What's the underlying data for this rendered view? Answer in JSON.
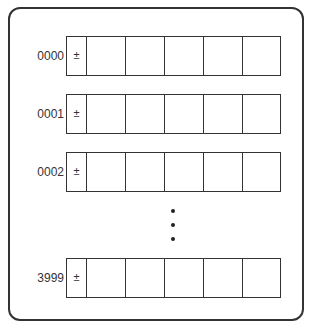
{
  "diagram": {
    "type": "memory-word-layout",
    "rows": [
      {
        "address": "0000",
        "sign": "±",
        "cells": [
          "",
          "",
          "",
          "",
          ""
        ]
      },
      {
        "address": "0001",
        "sign": "±",
        "cells": [
          "",
          "",
          "",
          "",
          ""
        ]
      },
      {
        "address": "0002",
        "sign": "±",
        "cells": [
          "",
          "",
          "",
          "",
          ""
        ]
      },
      {
        "address": "3999",
        "sign": "±",
        "cells": [
          "",
          "",
          "",
          "",
          ""
        ]
      }
    ],
    "ellipsis": "vertical-dots",
    "colors": {
      "stroke": "#333333",
      "background": "#ffffff"
    }
  }
}
